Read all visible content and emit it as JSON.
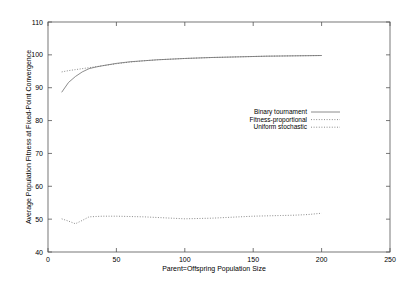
{
  "chart_data": {
    "type": "line",
    "title": "",
    "xlabel": "Parent=Offspring Population Size",
    "ylabel": "Average Population Fitness at Fixed-Point Convergence",
    "xlim": [
      0,
      250
    ],
    "ylim": [
      40,
      110
    ],
    "xticks": [
      0,
      50,
      100,
      150,
      200,
      250
    ],
    "yticks": [
      40,
      50,
      60,
      70,
      80,
      90,
      100,
      110
    ],
    "grid": false,
    "legend_position": "center-right",
    "x": [
      10,
      15,
      20,
      25,
      30,
      35,
      40,
      50,
      60,
      70,
      80,
      90,
      100,
      110,
      120,
      130,
      140,
      150,
      160,
      170,
      180,
      190,
      200
    ],
    "series": [
      {
        "name": "Binary tournament",
        "style": "solid",
        "values": [
          88.6,
          91.6,
          93.4,
          94.8,
          95.8,
          96.3,
          96.7,
          97.4,
          97.9,
          98.2,
          98.5,
          98.7,
          98.9,
          99.05,
          99.2,
          99.3,
          99.4,
          99.5,
          99.6,
          99.65,
          99.7,
          99.75,
          99.8
        ]
      },
      {
        "name": "Fitness-proportional",
        "style": "dotted",
        "values": [
          94.8,
          95.2,
          95.5,
          95.8,
          96.1,
          96.4,
          96.7,
          97.3,
          97.8,
          98.2,
          98.5,
          98.7,
          98.9,
          99.05,
          99.2,
          99.3,
          99.4,
          99.5,
          99.6,
          99.65,
          99.7,
          99.75,
          99.8
        ]
      },
      {
        "name": "Uniform stochastic",
        "style": "dotted",
        "values": [
          50.1,
          49.4,
          48.6,
          49.6,
          50.7,
          50.8,
          50.9,
          50.9,
          50.8,
          50.7,
          50.5,
          50.3,
          50.1,
          50.2,
          50.3,
          50.5,
          50.7,
          50.9,
          51.0,
          51.1,
          51.2,
          51.4,
          51.8
        ]
      }
    ]
  },
  "axis": {
    "x_tick_labels": [
      "0",
      "50",
      "100",
      "150",
      "200",
      "250"
    ],
    "y_tick_labels": [
      "40",
      "50",
      "60",
      "70",
      "80",
      "90",
      "100",
      "110"
    ],
    "x_title": "Parent=Offspring Population Size",
    "y_title": "Average Population Fitness at Fixed-Point Convergence"
  },
  "legend": {
    "items": [
      {
        "label": "Binary tournament"
      },
      {
        "label": "Fitness-proportional"
      },
      {
        "label": "Uniform stochastic"
      }
    ]
  },
  "colors": {
    "line": "#6e6e6e",
    "axis": "#555555",
    "text": "#000000",
    "background": "#ffffff"
  }
}
